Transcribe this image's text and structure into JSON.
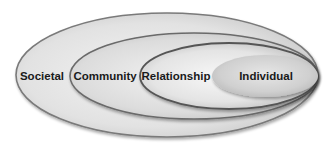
{
  "diagram": {
    "type": "nested-ellipses",
    "levels": [
      {
        "label": "Societal",
        "cx": 167,
        "cy": 75,
        "rx": 151,
        "ry": 62,
        "label_x": 42,
        "label_y": 77
      },
      {
        "label": "Community",
        "cx": 194,
        "cy": 76,
        "rx": 124,
        "ry": 43,
        "label_x": 105,
        "label_y": 77
      },
      {
        "label": "Relationship",
        "cx": 229,
        "cy": 76,
        "rx": 89,
        "ry": 33,
        "label_x": 176,
        "label_y": 77
      },
      {
        "label": "Individual",
        "cx": 265,
        "cy": 76,
        "rx": 53,
        "ry": 21,
        "label_x": 266,
        "label_y": 77
      }
    ],
    "colors": {
      "background": "#ffffff",
      "outline": "#6e6e6e",
      "fill_light": "#f2f2f2",
      "fill_mid": "#d6d6d6",
      "fill_dark": "#bdbdbd",
      "text": "#1a1a1a"
    }
  }
}
